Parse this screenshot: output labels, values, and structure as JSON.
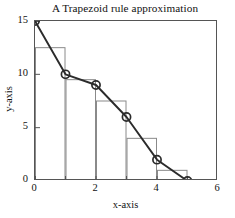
{
  "chart_data": {
    "type": "line",
    "title": "A Trapezoid rule approximation",
    "xlabel": "x-axis",
    "ylabel": "y-axis",
    "xlim": [
      0,
      6
    ],
    "ylim": [
      0,
      15
    ],
    "grid": false,
    "legend": "none",
    "x_ticks": [
      {
        "value": 0,
        "label": "0"
      },
      {
        "value": 1,
        "label": ""
      },
      {
        "value": 2,
        "label": "2"
      },
      {
        "value": 3,
        "label": ""
      },
      {
        "value": 4,
        "label": "4"
      },
      {
        "value": 5,
        "label": ""
      },
      {
        "value": 6,
        "label": "6"
      }
    ],
    "y_ticks": [
      {
        "value": 0,
        "label": "0"
      },
      {
        "value": 5,
        "label": "5"
      },
      {
        "value": 10,
        "label": "10"
      },
      {
        "value": 15,
        "label": "15"
      }
    ],
    "series": [
      {
        "name": "function curve",
        "marker": "open-circle",
        "color": "#2b2b2b",
        "x": [
          0,
          1,
          2,
          3,
          4,
          5
        ],
        "values": [
          15,
          10,
          9,
          6,
          2,
          0
        ]
      },
      {
        "name": "trapezoid bars",
        "type": "bar",
        "color": "#8a8a8a",
        "x_edges": [
          0,
          1,
          2,
          3,
          4,
          5
        ],
        "values": [
          12.5,
          9.5,
          7.5,
          4,
          1
        ]
      }
    ]
  }
}
